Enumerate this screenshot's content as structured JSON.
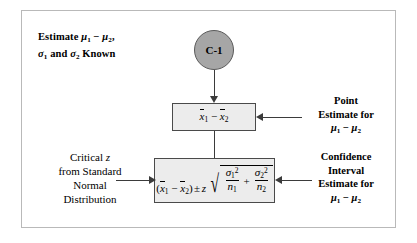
{
  "diagram": {
    "title_block": {
      "line1": "Estimate μ₁ − μ₂,",
      "line2": "σ₁ and σ₂ Known"
    },
    "start_node": {
      "label": "C-1",
      "shape": "ellipse",
      "fill_color": "#a6a6a6",
      "border_color": "#5a5a5a"
    },
    "boxes": [
      {
        "id": "point-estimate-box",
        "formula": "x̅1 − x̅2",
        "fill_color": "#ececec",
        "border_color": "#4a4a4a"
      },
      {
        "id": "confidence-interval-box",
        "formula": "(x̅1 − x̅2) ± z √(σ₁²/n₁ + σ₂²/n₂)",
        "fill_color": "#ececec",
        "border_color": "#4a4a4a"
      }
    ],
    "annotations": {
      "point_estimate": {
        "line1": "Point",
        "line2": "Estimate for",
        "line3": "μ₁ − μ₂"
      },
      "confidence_interval": {
        "line1": "Confidence",
        "line2": "Interval",
        "line3": "Estimate for",
        "line4": "μ₁ − μ₂"
      },
      "critical_z": {
        "line1": "Critical z",
        "line2": "from Standard",
        "line3": "Normal",
        "line4": "Distribution"
      }
    },
    "frame": {
      "border_color": "#b9b9b9",
      "background": "#ffffff"
    },
    "connector_color": "#3b3b3b"
  }
}
